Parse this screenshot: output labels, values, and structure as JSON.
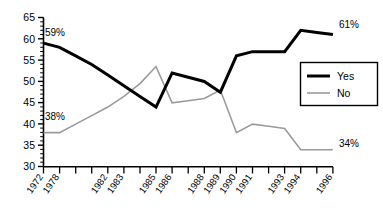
{
  "chart_data": {
    "type": "line",
    "title": "",
    "subtitle": "",
    "xlabel": "",
    "ylabel": "",
    "ylim": [
      30,
      65
    ],
    "yticks": [
      30,
      35,
      40,
      45,
      50,
      55,
      60,
      65
    ],
    "ytick_labels": [
      "30",
      "35",
      "40",
      "45",
      "50",
      "55",
      "60",
      "65"
    ],
    "grid": false,
    "legend_position": "right",
    "categories": [
      "1972",
      "1978",
      "",
      "",
      "1982",
      "1983",
      "",
      "1985",
      "1986",
      "",
      "1988",
      "1989",
      "1990",
      "1991",
      "",
      "1993",
      "1994",
      "",
      "1996"
    ],
    "xtick_labels": [
      "1972",
      "1978",
      "1982",
      "1983",
      "1985",
      "1986",
      "1988",
      "1989",
      "1990",
      "1991",
      "1993",
      "1994",
      "1996"
    ],
    "series": [
      {
        "name": "Yes",
        "color": "#000000",
        "width": 3.0,
        "values": [
          59,
          58,
          56,
          54,
          51.5,
          49,
          46.5,
          44,
          52,
          51,
          50,
          47.5,
          56,
          57,
          57,
          57,
          62,
          61.5,
          61
        ]
      },
      {
        "name": "No",
        "color": "#9a9a9a",
        "width": 1.6,
        "values": [
          38,
          38,
          40,
          42,
          44,
          46.5,
          49.5,
          53.5,
          45,
          45.5,
          46,
          48,
          38,
          40,
          39.5,
          39,
          34,
          34,
          34
        ]
      }
    ],
    "annotations": [
      {
        "text": "59%",
        "series": "Yes",
        "index": 0,
        "position": "above-left"
      },
      {
        "text": "61%",
        "series": "Yes",
        "index": 18,
        "position": "above-right"
      },
      {
        "text": "38%",
        "series": "No",
        "index": 0,
        "position": "above-left"
      },
      {
        "text": "34%",
        "series": "No",
        "index": 18,
        "position": "above-right"
      }
    ]
  },
  "labels": {
    "y_65": "65",
    "y_60": "60",
    "y_55": "55",
    "y_50": "50",
    "y_45": "45",
    "y_40": "40",
    "y_35": "35",
    "y_30": "30",
    "x_1972": "1972",
    "x_1978": "1978",
    "x_1982": "1982",
    "x_1983": "1983",
    "x_1985": "1985",
    "x_1986": "1986",
    "x_1988": "1988",
    "x_1989": "1989",
    "x_1990": "1990",
    "x_1991": "1991",
    "x_1993": "1993",
    "x_1994": "1994",
    "x_1996": "1996",
    "ann_59": "59%",
    "ann_61": "61%",
    "ann_38": "38%",
    "ann_34": "34%"
  },
  "legend": {
    "items": [
      {
        "label": "Yes",
        "color": "#000000"
      },
      {
        "label": "No",
        "color": "#9a9a9a"
      }
    ],
    "yes_label": "Yes",
    "no_label": "No"
  },
  "colors": {
    "yes": "#000000",
    "no": "#9a9a9a",
    "axis": "#000000",
    "background": "#ffffff"
  }
}
